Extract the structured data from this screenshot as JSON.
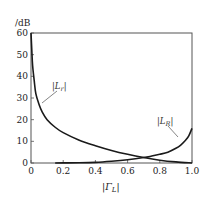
{
  "chart_data": {
    "type": "line",
    "title": "",
    "xlabel": "|Γ_L|",
    "ylabel": "/dB",
    "xlim": [
      0,
      1.0
    ],
    "ylim": [
      0,
      60
    ],
    "x_ticks": [
      "0",
      "0.2",
      "0.4",
      "0.6",
      "0.8",
      "1.0"
    ],
    "y_ticks": [
      "0",
      "10",
      "20",
      "30",
      "40",
      "50",
      "60"
    ],
    "grid": false,
    "legend": "inline annotations",
    "series": [
      {
        "name": "|L_r|",
        "x": [
          0.0,
          0.005,
          0.01,
          0.02,
          0.03,
          0.05,
          0.07,
          0.1,
          0.15,
          0.2,
          0.3,
          0.4,
          0.5,
          0.6,
          0.7,
          0.8,
          0.9,
          1.0
        ],
        "y": [
          60,
          52,
          45,
          38,
          32,
          27,
          23.5,
          20,
          16.5,
          14,
          10.5,
          8,
          5.8,
          4,
          2.5,
          1.3,
          0.5,
          0
        ]
      },
      {
        "name": "|L_R|",
        "x": [
          0.15,
          0.2,
          0.3,
          0.4,
          0.5,
          0.6,
          0.7,
          0.75,
          0.8,
          0.85,
          0.9,
          0.93,
          0.96,
          0.98,
          1.0
        ],
        "y": [
          0,
          0.05,
          0.1,
          0.3,
          0.8,
          1.5,
          2.5,
          3.2,
          4,
          5,
          6.8,
          8.3,
          10.5,
          12.5,
          16
        ]
      }
    ],
    "annotations": [
      {
        "text": "|L_r|",
        "x": 0.08,
        "y": 29
      },
      {
        "text": "|L_R|",
        "x": 0.88,
        "y": 16
      }
    ]
  },
  "labels": {
    "unit": "/dB",
    "x_title": "|Γ",
    "x_title_sub": "L",
    "lr_main": "|L",
    "lr_sub": "r",
    "lR_main": "|L",
    "lR_sub": "R",
    "bar": "|"
  },
  "style": {
    "curve_color": "#1a1a1a",
    "frame_color": "#555555",
    "leader_color": "#666666"
  }
}
